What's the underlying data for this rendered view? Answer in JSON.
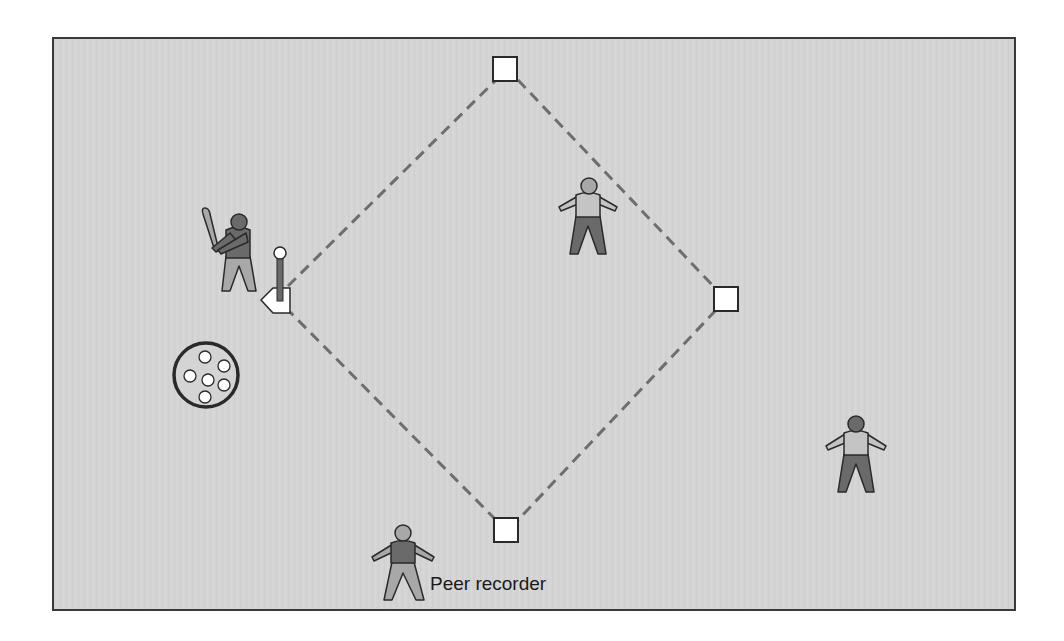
{
  "diagram": {
    "title": "",
    "type": "baseball-tee-drill-field",
    "colors": {
      "field_background": "#d4d4d4",
      "frame_border": "#3a3a3a",
      "base_fill": "#ffffff",
      "outline": "#2a2a2a",
      "base_path_dash": "#6e6e6e",
      "dark_fill": "#6a6a6a",
      "light_fill": "#a8a8a8",
      "shirt_light": "#c4c4c4"
    },
    "field": {
      "x": 53,
      "y": 38,
      "width": 962,
      "height": 572
    },
    "bases": [
      {
        "name": "second-base",
        "x": 493,
        "y": 57,
        "size": 24
      },
      {
        "name": "first-base",
        "x": 714,
        "y": 287,
        "size": 24
      },
      {
        "name": "third-base",
        "x": 494,
        "y": 518,
        "size": 24
      }
    ],
    "home_plate": {
      "name": "home-plate",
      "tip_x": 261,
      "tip_y": 300
    },
    "batting_tee": {
      "x": 280,
      "ball_y": 253,
      "base_y": 302
    },
    "ball_bucket": {
      "cx": 206,
      "cy": 375,
      "r": 33,
      "ball_count": 6
    },
    "players": [
      {
        "role": "batter",
        "x": 238,
        "y": 222
      },
      {
        "role": "fielder-center",
        "x": 588,
        "y": 186
      },
      {
        "role": "fielder-right",
        "x": 856,
        "y": 425
      },
      {
        "role": "peer-recorder",
        "x": 403,
        "y": 533
      }
    ],
    "labels": {
      "peer_recorder": "Peer recorder"
    }
  }
}
